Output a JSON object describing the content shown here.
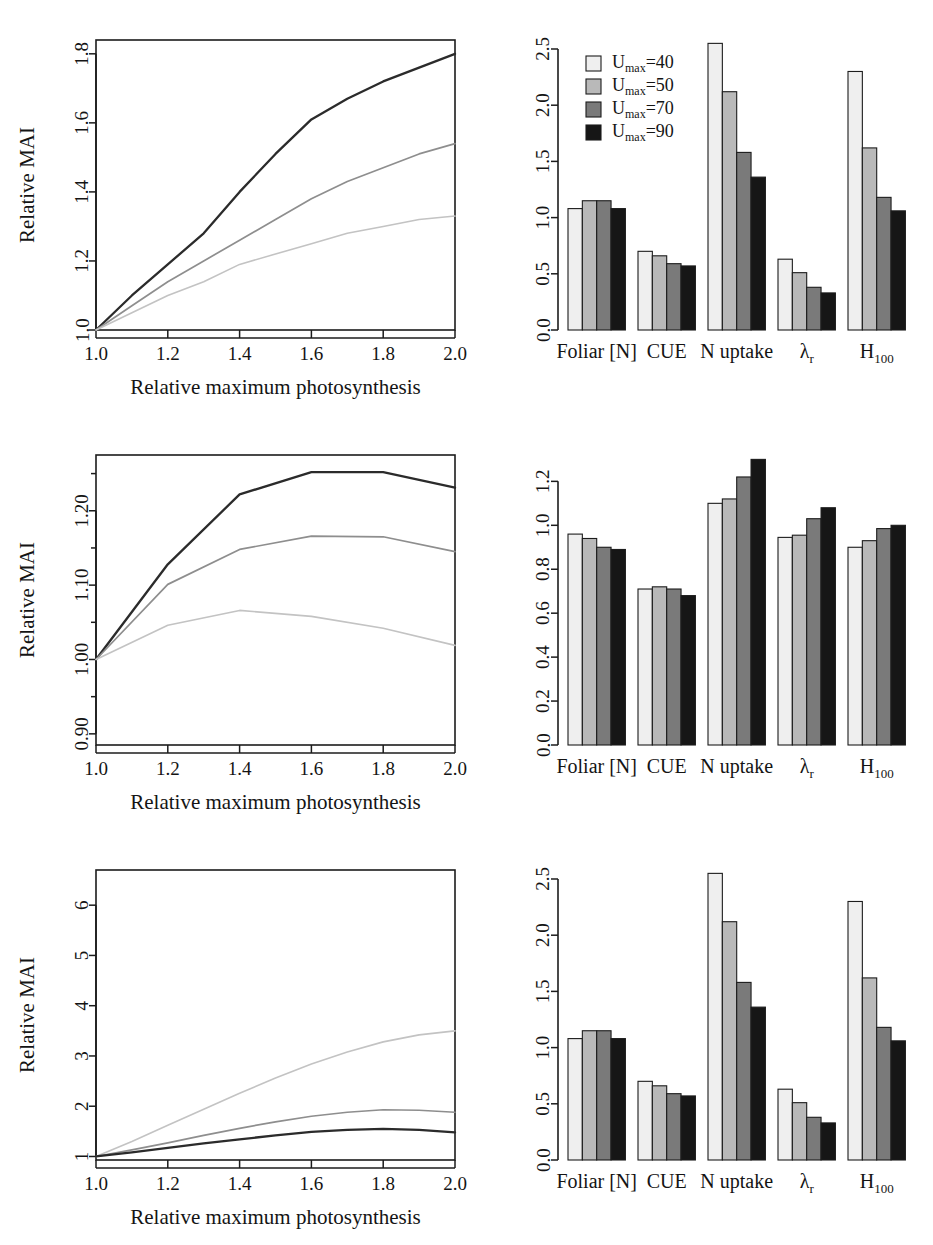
{
  "figure": {
    "axis_labels": {
      "x": "Relative maximum photosynthesis",
      "y": "Relative MAI"
    },
    "legend": {
      "items": [
        {
          "label": "U",
          "sub": "max",
          "eq": "=40",
          "full": "Umax=40",
          "color": "#efefef"
        },
        {
          "label": "U",
          "sub": "max",
          "eq": "=50",
          "full": "Umax=50",
          "color": "#b9b9b9"
        },
        {
          "label": "U",
          "sub": "max",
          "eq": "=70",
          "full": "Umax=70",
          "color": "#7a7a7a"
        },
        {
          "label": "U",
          "sub": "max",
          "eq": "=90",
          "full": "Umax=90",
          "color": "#161616"
        }
      ]
    }
  },
  "chart_data": [
    {
      "id": "panel-1",
      "position": "top-left",
      "type": "line",
      "title": "",
      "xlabel": "Relative maximum photosynthesis",
      "ylabel": "Relative MAI",
      "xlim": [
        1.0,
        2.0
      ],
      "ylim": [
        1.0,
        1.84
      ],
      "xticks": [
        1.0,
        1.2,
        1.4,
        1.6,
        1.8,
        2.0
      ],
      "xticklabels": [
        "1.0",
        "1.2",
        "1.4",
        "1.6",
        "1.8",
        "2.0"
      ],
      "yticks": [
        1.0,
        1.2,
        1.4,
        1.6,
        1.8
      ],
      "yticklabels": [
        "1.0",
        "1.2",
        "1.4",
        "1.6",
        "1.8"
      ],
      "grid": false,
      "legend": "none",
      "x": [
        1.0,
        1.1,
        1.2,
        1.3,
        1.4,
        1.5,
        1.6,
        1.7,
        1.8,
        1.9,
        2.0
      ],
      "series": [
        {
          "name": "dark",
          "color": "#2b2b2b",
          "values": [
            1.0,
            1.1,
            1.19,
            1.28,
            1.4,
            1.51,
            1.61,
            1.67,
            1.72,
            1.76,
            1.8
          ]
        },
        {
          "name": "mid",
          "color": "#8e8e8e",
          "values": [
            1.0,
            1.07,
            1.14,
            1.2,
            1.26,
            1.32,
            1.38,
            1.43,
            1.47,
            1.51,
            1.54
          ]
        },
        {
          "name": "light",
          "color": "#c3c3c3",
          "values": [
            1.0,
            1.05,
            1.1,
            1.14,
            1.19,
            1.22,
            1.25,
            1.28,
            1.3,
            1.32,
            1.33
          ]
        }
      ]
    },
    {
      "id": "panel-2",
      "position": "top-right",
      "type": "bar",
      "title": "",
      "xlabel": "",
      "ylabel": "",
      "ylim": [
        0.0,
        2.58
      ],
      "yticks": [
        0.0,
        0.5,
        1.0,
        1.5,
        2.0,
        2.5
      ],
      "yticklabels": [
        "0.0",
        "0.5",
        "1.0",
        "1.5",
        "2.0",
        "2.5"
      ],
      "grid": false,
      "legend": "top-left",
      "categories": [
        "Foliar [N]",
        "CUE",
        "N uptake",
        "λ",
        "H"
      ],
      "category_subs": [
        "",
        "",
        "",
        "r",
        "100"
      ],
      "series": [
        {
          "name": "Umax=40",
          "color": "#efefef",
          "values": [
            1.08,
            0.7,
            2.55,
            0.63,
            2.3
          ]
        },
        {
          "name": "Umax=50",
          "color": "#b9b9b9",
          "values": [
            1.15,
            0.66,
            2.12,
            0.51,
            1.62
          ]
        },
        {
          "name": "Umax=70",
          "color": "#7a7a7a",
          "values": [
            1.15,
            0.59,
            1.58,
            0.38,
            1.18
          ]
        },
        {
          "name": "Umax=90",
          "color": "#161616",
          "values": [
            1.08,
            0.57,
            1.36,
            0.33,
            1.06
          ]
        }
      ]
    },
    {
      "id": "panel-3",
      "position": "middle-left",
      "type": "line",
      "title": "",
      "xlabel": "Relative maximum photosynthesis",
      "ylabel": "Relative MAI",
      "xlim": [
        1.0,
        2.0
      ],
      "ylim": [
        0.885,
        1.275
      ],
      "xticks": [
        1.0,
        1.2,
        1.4,
        1.6,
        1.8,
        2.0
      ],
      "xticklabels": [
        "1.0",
        "1.2",
        "1.4",
        "1.6",
        "1.8",
        "2.0"
      ],
      "yticks": [
        0.9,
        1.0,
        1.1,
        1.2
      ],
      "yticklabels": [
        "0.90",
        "1.00",
        "1.10",
        "1.20"
      ],
      "yminor": [
        0.95,
        1.05,
        1.15,
        1.25
      ],
      "grid": false,
      "legend": "none",
      "x": [
        1.0,
        1.2,
        1.4,
        1.6,
        1.8,
        2.0
      ],
      "series": [
        {
          "name": "dark",
          "color": "#2b2b2b",
          "values": [
            1.0,
            1.128,
            1.222,
            1.252,
            1.252,
            1.231
          ]
        },
        {
          "name": "mid",
          "color": "#8e8e8e",
          "values": [
            1.0,
            1.101,
            1.148,
            1.166,
            1.165,
            1.145
          ]
        },
        {
          "name": "light",
          "color": "#c3c3c3",
          "values": [
            1.0,
            1.046,
            1.066,
            1.058,
            1.042,
            1.019
          ]
        }
      ]
    },
    {
      "id": "panel-4",
      "position": "middle-right",
      "type": "bar",
      "title": "",
      "xlabel": "",
      "ylabel": "",
      "ylim": [
        0.0,
        1.32
      ],
      "yticks": [
        0.0,
        0.2,
        0.4,
        0.6,
        0.8,
        1.0,
        1.2
      ],
      "yticklabels": [
        "0.0",
        "0.2",
        "0.4",
        "0.6",
        "0.8",
        "1.0",
        "1.2"
      ],
      "grid": false,
      "legend": "none",
      "categories": [
        "Foliar [N]",
        "CUE",
        "N uptake",
        "λ",
        "H"
      ],
      "category_subs": [
        "",
        "",
        "",
        "r",
        "100"
      ],
      "series": [
        {
          "name": "Umax=40",
          "color": "#efefef",
          "values": [
            0.96,
            0.71,
            1.1,
            0.945,
            0.9
          ]
        },
        {
          "name": "Umax=50",
          "color": "#b9b9b9",
          "values": [
            0.94,
            0.72,
            1.12,
            0.955,
            0.93
          ]
        },
        {
          "name": "Umax=70",
          "color": "#7a7a7a",
          "values": [
            0.9,
            0.71,
            1.22,
            1.03,
            0.985
          ]
        },
        {
          "name": "Umax=90",
          "color": "#161616",
          "values": [
            0.89,
            0.68,
            1.3,
            1.08,
            1.0
          ]
        }
      ]
    },
    {
      "id": "panel-5",
      "position": "bottom-left",
      "type": "line",
      "title": "",
      "xlabel": "Relative maximum photosynthesis",
      "ylabel": "Relative MAI",
      "xlim": [
        1.0,
        2.0
      ],
      "ylim": [
        0.93,
        6.7
      ],
      "xticks": [
        1.0,
        1.2,
        1.4,
        1.6,
        1.8,
        2.0
      ],
      "xticklabels": [
        "1.0",
        "1.2",
        "1.4",
        "1.6",
        "1.8",
        "2.0"
      ],
      "yticks": [
        1,
        2,
        3,
        4,
        5,
        6
      ],
      "yticklabels": [
        "1",
        "2",
        "3",
        "4",
        "5",
        "6"
      ],
      "grid": false,
      "legend": "none",
      "x": [
        1.0,
        1.1,
        1.2,
        1.3,
        1.4,
        1.5,
        1.6,
        1.7,
        1.8,
        1.9,
        2.0
      ],
      "series": [
        {
          "name": "light",
          "color": "#c3c3c3",
          "values": [
            1.0,
            1.3,
            1.62,
            1.94,
            2.26,
            2.56,
            2.84,
            3.08,
            3.28,
            3.42,
            3.5
          ]
        },
        {
          "name": "mid",
          "color": "#8e8e8e",
          "values": [
            1.0,
            1.13,
            1.27,
            1.42,
            1.56,
            1.69,
            1.8,
            1.88,
            1.93,
            1.92,
            1.88
          ]
        },
        {
          "name": "dark",
          "color": "#2b2b2b",
          "values": [
            1.0,
            1.08,
            1.17,
            1.26,
            1.34,
            1.42,
            1.49,
            1.53,
            1.55,
            1.53,
            1.48
          ]
        }
      ]
    },
    {
      "id": "panel-6",
      "position": "bottom-right",
      "type": "bar",
      "title": "",
      "xlabel": "",
      "ylabel": "",
      "ylim": [
        0.0,
        2.58
      ],
      "yticks": [
        0.0,
        0.5,
        1.0,
        1.5,
        2.0,
        2.5
      ],
      "yticklabels": [
        "0.0",
        "0.5",
        "1.0",
        "1.5",
        "2.0",
        "2.5"
      ],
      "grid": false,
      "legend": "none",
      "categories": [
        "Foliar [N]",
        "CUE",
        "N uptake",
        "λ",
        "H"
      ],
      "category_subs": [
        "",
        "",
        "",
        "r",
        "100"
      ],
      "series": [
        {
          "name": "Umax=40",
          "color": "#efefef",
          "values": [
            1.08,
            0.7,
            2.55,
            0.63,
            2.3
          ]
        },
        {
          "name": "Umax=50",
          "color": "#b9b9b9",
          "values": [
            1.15,
            0.66,
            2.12,
            0.51,
            1.62
          ]
        },
        {
          "name": "Umax=70",
          "color": "#7a7a7a",
          "values": [
            1.15,
            0.59,
            1.58,
            0.38,
            1.18
          ]
        },
        {
          "name": "Umax=90",
          "color": "#161616",
          "values": [
            1.08,
            0.57,
            1.36,
            0.33,
            1.06
          ]
        }
      ]
    }
  ]
}
